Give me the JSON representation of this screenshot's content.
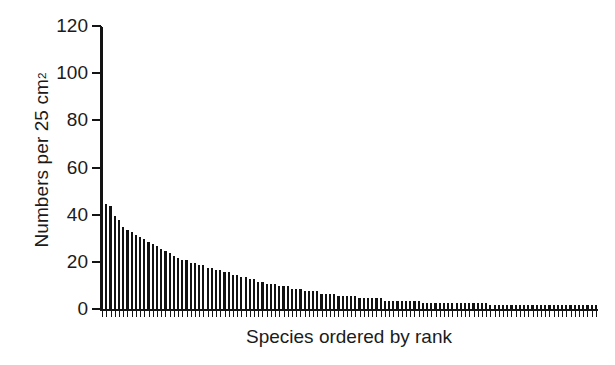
{
  "chart_data": {
    "type": "bar",
    "title": "",
    "subtitle": "",
    "xlabel": "Species ordered by rank",
    "ylabel": "Numbers per 25 cm",
    "ylabel_superscript": "2",
    "ylabel_full": "Numbers per 25 cm2",
    "ylim": [
      0,
      120
    ],
    "yticks": [
      0,
      20,
      40,
      60,
      80,
      100,
      120
    ],
    "ytick_labels": [
      "0",
      "20",
      "40",
      "60",
      "80",
      "100",
      "120"
    ],
    "xticks_labeled": false,
    "xtick_labels": [],
    "grid": false,
    "legend": false,
    "legend_position": "none",
    "bar_color": "#121212",
    "background_color": "#ffffff",
    "axis_color": "#141414",
    "n_bars": 118,
    "note_first_bar_clipped": true,
    "categories": [
      1,
      2,
      3,
      4,
      5,
      6,
      7,
      8,
      9,
      10,
      11,
      12,
      13,
      14,
      15,
      16,
      17,
      18,
      19,
      20,
      21,
      22,
      23,
      24,
      25,
      26,
      27,
      28,
      29,
      30,
      31,
      32,
      33,
      34,
      35,
      36,
      37,
      38,
      39,
      40,
      41,
      42,
      43,
      44,
      45,
      46,
      47,
      48,
      49,
      50,
      51,
      52,
      53,
      54,
      55,
      56,
      57,
      58,
      59,
      60,
      61,
      62,
      63,
      64,
      65,
      66,
      67,
      68,
      69,
      70,
      71,
      72,
      73,
      74,
      75,
      76,
      77,
      78,
      79,
      80,
      81,
      82,
      83,
      84,
      85,
      86,
      87,
      88,
      89,
      90,
      91,
      92,
      93,
      94,
      95,
      96,
      97,
      98,
      99,
      100,
      101,
      102,
      103,
      104,
      105,
      106,
      107,
      108,
      109,
      110,
      111,
      112,
      113,
      114,
      115,
      116,
      117,
      118
    ],
    "values": [
      120,
      45,
      44,
      40,
      38,
      35,
      34,
      33,
      32,
      31,
      30,
      29,
      28,
      27,
      26,
      25,
      24,
      23,
      22,
      21,
      21,
      20,
      20,
      19,
      19,
      18,
      18,
      17,
      17,
      16,
      16,
      15,
      15,
      14,
      14,
      13,
      13,
      12,
      12,
      11,
      11,
      11,
      10,
      10,
      10,
      9,
      9,
      9,
      8,
      8,
      8,
      8,
      7,
      7,
      7,
      7,
      6,
      6,
      6,
      6,
      6,
      5,
      5,
      5,
      5,
      5,
      5,
      4,
      4,
      4,
      4,
      4,
      4,
      4,
      4,
      4,
      3,
      3,
      3,
      3,
      3,
      3,
      3,
      3,
      3,
      3,
      3,
      3,
      3,
      3,
      3,
      3,
      2,
      2,
      2,
      2,
      2,
      2,
      2,
      2,
      2,
      2,
      2,
      2,
      2,
      2,
      2,
      2,
      2,
      2,
      2,
      2,
      2,
      2,
      2,
      2,
      2,
      2
    ]
  },
  "figure": {
    "caption": ""
  }
}
